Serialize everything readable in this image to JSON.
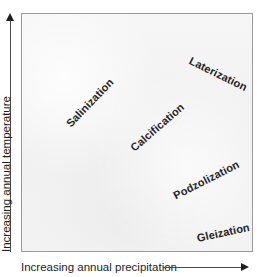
{
  "figure": {
    "kind": "soil-formation-process-diagram",
    "background_color": "#ffffff",
    "plot_fill_color": "#f2f2f2",
    "plot_border_color": "#9a9a9a",
    "text_color": "#1d1d1d",
    "label_color": "#242424"
  },
  "axes": {
    "y": {
      "label": "Increasing annual temperature",
      "arrow_icon": "arrow-up-icon",
      "direction": "up"
    },
    "x": {
      "label": "Increasing annual precipitation",
      "arrow_icon": "arrow-right-icon",
      "direction": "right"
    }
  },
  "chart_data": {
    "type": "scatter",
    "title": "",
    "subtitle": "",
    "xlabel": "Increasing annual precipitation",
    "ylabel": "Increasing annual temperature",
    "xlim": [
      0,
      1
    ],
    "ylim": [
      0,
      1
    ],
    "grid": false,
    "legend": null,
    "axis_tick_labels": {
      "x": [],
      "y": []
    },
    "note": "Qualitative conceptual diagram: soil-forming regimes plotted by relative moisture (x) and relative temperature (y); labels are rotated text, no plotted points or tick values.",
    "annotations": [
      {
        "label": "Salinization",
        "x": 0.11,
        "y": 0.66,
        "rotation_deg": -46,
        "quadrant": "dry / warm"
      },
      {
        "label": "Calcification",
        "x": 0.38,
        "y": 0.56,
        "rotation_deg": -41,
        "quadrant": "sub-humid / warm"
      },
      {
        "label": "Laterization",
        "x": 0.7,
        "y": 0.86,
        "rotation_deg": 26,
        "quadrant": "wet / hot"
      },
      {
        "label": "Podzolization",
        "x": 0.62,
        "y": 0.34,
        "rotation_deg": -27,
        "quadrant": "wet / cool"
      },
      {
        "label": "Gleization",
        "x": 0.72,
        "y": 0.15,
        "rotation_deg": -12,
        "quadrant": "very wet / cold"
      }
    ]
  },
  "labels": {
    "salinization": "Salinization",
    "calcification": "Calcification",
    "laterization": "Laterization",
    "podzolization": "Podzolization",
    "gleization": "Gleization"
  }
}
